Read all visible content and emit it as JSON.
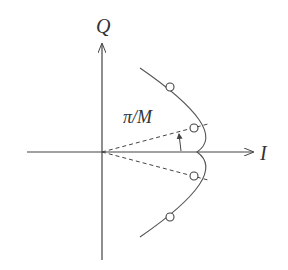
{
  "diagram": {
    "axes": {
      "x_label": "I",
      "y_label": "Q"
    },
    "angle_label": "π/M",
    "constellation_points": [
      {
        "x": 170,
        "y": 87
      },
      {
        "x": 194,
        "y": 128
      },
      {
        "x": 194,
        "y": 176
      },
      {
        "x": 170,
        "y": 217
      }
    ],
    "colors": {
      "stroke": "#444444",
      "background": "#ffffff"
    }
  }
}
